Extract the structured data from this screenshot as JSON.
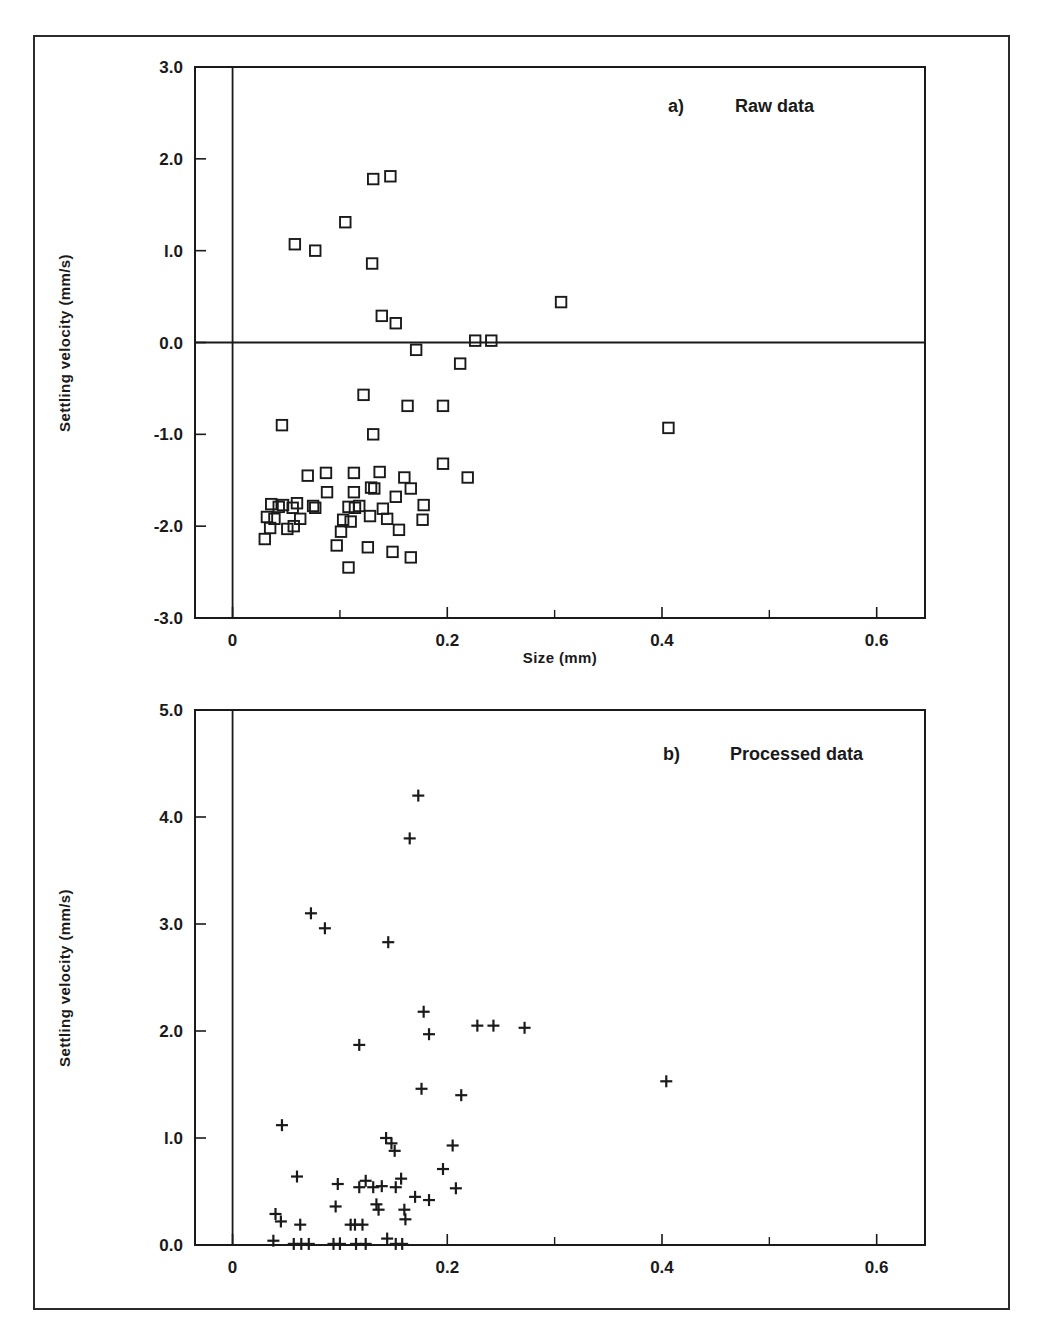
{
  "figure": {
    "background_color": "#ffffff",
    "ink_color": "#1a1a1a",
    "border_color": "#2b2b2b"
  },
  "chart_data": [
    {
      "type": "scatter",
      "panel_tag": "a)",
      "title": "Raw data",
      "xlabel": "Size (mm)",
      "ylabel": "Settling velocity (mm/s)",
      "xlim": [
        -0.035,
        0.645
      ],
      "ylim": [
        -3.0,
        3.0
      ],
      "xticks": [
        0,
        0.2,
        0.4,
        0.6
      ],
      "xticklabels": [
        "0",
        "0.2",
        "0.4",
        "0.6"
      ],
      "xminorticks": [
        0.1,
        0.3,
        0.5
      ],
      "yticks": [
        -3.0,
        -2.0,
        -1.0,
        0.0,
        1.0,
        2.0,
        3.0
      ],
      "yticklabels": [
        "-3.0",
        "-2.0",
        "-1.0",
        "0.0",
        "l.0",
        "2.0",
        "3.0"
      ],
      "grid": false,
      "zero_line_y": 0.0,
      "zero_line_x": 0.0,
      "marker": "open-square",
      "points": [
        [
          0.058,
          1.07
        ],
        [
          0.077,
          1.0
        ],
        [
          0.105,
          1.31
        ],
        [
          0.131,
          1.78
        ],
        [
          0.147,
          1.81
        ],
        [
          0.13,
          0.86
        ],
        [
          0.139,
          0.29
        ],
        [
          0.152,
          0.21
        ],
        [
          0.306,
          0.44
        ],
        [
          0.171,
          -0.08
        ],
        [
          0.226,
          0.02
        ],
        [
          0.241,
          0.02
        ],
        [
          0.212,
          -0.23
        ],
        [
          0.046,
          -0.9
        ],
        [
          0.122,
          -0.57
        ],
        [
          0.131,
          -1.0
        ],
        [
          0.163,
          -0.69
        ],
        [
          0.196,
          -0.69
        ],
        [
          0.406,
          -0.93
        ],
        [
          0.07,
          -1.45
        ],
        [
          0.087,
          -1.42
        ],
        [
          0.113,
          -1.42
        ],
        [
          0.137,
          -1.41
        ],
        [
          0.16,
          -1.47
        ],
        [
          0.196,
          -1.32
        ],
        [
          0.219,
          -1.47
        ],
        [
          0.129,
          -1.58
        ],
        [
          0.132,
          -1.59
        ],
        [
          0.088,
          -1.63
        ],
        [
          0.113,
          -1.63
        ],
        [
          0.152,
          -1.68
        ],
        [
          0.036,
          -1.76
        ],
        [
          0.043,
          -1.79
        ],
        [
          0.047,
          -1.77
        ],
        [
          0.056,
          -1.8
        ],
        [
          0.06,
          -1.75
        ],
        [
          0.075,
          -1.78
        ],
        [
          0.077,
          -1.8
        ],
        [
          0.108,
          -1.79
        ],
        [
          0.114,
          -1.8
        ],
        [
          0.118,
          -1.78
        ],
        [
          0.14,
          -1.81
        ],
        [
          0.166,
          -1.59
        ],
        [
          0.178,
          -1.77
        ],
        [
          0.032,
          -1.9
        ],
        [
          0.039,
          -1.92
        ],
        [
          0.063,
          -1.92
        ],
        [
          0.103,
          -1.93
        ],
        [
          0.11,
          -1.95
        ],
        [
          0.128,
          -1.89
        ],
        [
          0.144,
          -1.92
        ],
        [
          0.177,
          -1.93
        ],
        [
          0.035,
          -2.02
        ],
        [
          0.051,
          -2.03
        ],
        [
          0.057,
          -2.0
        ],
        [
          0.101,
          -2.06
        ],
        [
          0.155,
          -2.04
        ],
        [
          0.03,
          -2.14
        ],
        [
          0.097,
          -2.21
        ],
        [
          0.126,
          -2.23
        ],
        [
          0.149,
          -2.28
        ],
        [
          0.166,
          -2.34
        ],
        [
          0.108,
          -2.45
        ]
      ]
    },
    {
      "type": "scatter",
      "panel_tag": "b)",
      "title": "Processed data",
      "xlabel": "",
      "ylabel": "Settling velocity (mm/s)",
      "xlim": [
        -0.035,
        0.645
      ],
      "ylim": [
        0.0,
        5.0
      ],
      "xticks": [
        0,
        0.2,
        0.4,
        0.6
      ],
      "xticklabels": [
        "0",
        "0.2",
        "0.4",
        "0.6"
      ],
      "xminorticks": [
        0.1,
        0.3,
        0.5
      ],
      "yticks": [
        0.0,
        1.0,
        2.0,
        3.0,
        4.0,
        5.0
      ],
      "yticklabels": [
        "0.0",
        "l.0",
        "2.0",
        "3.0",
        "4.0",
        "5.0"
      ],
      "grid": false,
      "zero_line_x": 0.0,
      "marker": "plus",
      "points": [
        [
          0.173,
          4.2
        ],
        [
          0.165,
          3.8
        ],
        [
          0.073,
          3.1
        ],
        [
          0.086,
          2.96
        ],
        [
          0.145,
          2.83
        ],
        [
          0.178,
          2.18
        ],
        [
          0.183,
          1.97
        ],
        [
          0.228,
          2.05
        ],
        [
          0.243,
          2.05
        ],
        [
          0.272,
          2.03
        ],
        [
          0.118,
          1.87
        ],
        [
          0.404,
          1.53
        ],
        [
          0.176,
          1.46
        ],
        [
          0.213,
          1.4
        ],
        [
          0.046,
          1.12
        ],
        [
          0.143,
          1.0
        ],
        [
          0.148,
          0.95
        ],
        [
          0.151,
          0.88
        ],
        [
          0.205,
          0.93
        ],
        [
          0.196,
          0.71
        ],
        [
          0.06,
          0.64
        ],
        [
          0.098,
          0.57
        ],
        [
          0.118,
          0.54
        ],
        [
          0.124,
          0.6
        ],
        [
          0.131,
          0.54
        ],
        [
          0.139,
          0.55
        ],
        [
          0.152,
          0.54
        ],
        [
          0.157,
          0.62
        ],
        [
          0.208,
          0.53
        ],
        [
          0.17,
          0.45
        ],
        [
          0.183,
          0.42
        ],
        [
          0.096,
          0.36
        ],
        [
          0.134,
          0.38
        ],
        [
          0.136,
          0.33
        ],
        [
          0.16,
          0.33
        ],
        [
          0.161,
          0.24
        ],
        [
          0.04,
          0.29
        ],
        [
          0.045,
          0.22
        ],
        [
          0.063,
          0.19
        ],
        [
          0.11,
          0.19
        ],
        [
          0.114,
          0.19
        ],
        [
          0.121,
          0.19
        ],
        [
          0.038,
          0.04
        ],
        [
          0.057,
          0.01
        ],
        [
          0.064,
          0.01
        ],
        [
          0.071,
          0.01
        ],
        [
          0.094,
          0.01
        ],
        [
          0.1,
          0.01
        ],
        [
          0.115,
          0.01
        ],
        [
          0.124,
          0.01
        ],
        [
          0.144,
          0.06
        ],
        [
          0.152,
          0.01
        ],
        [
          0.158,
          0.01
        ]
      ]
    }
  ]
}
